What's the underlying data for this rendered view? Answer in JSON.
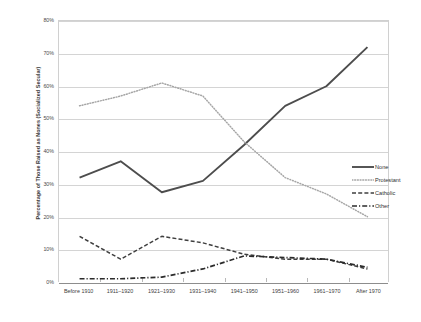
{
  "chart_data": {
    "type": "line",
    "title": "",
    "xlabel": "",
    "ylabel": "Percentage of Those Raised as Nones (Socialized Secular)",
    "ylim": [
      0,
      80
    ],
    "ytick_labels": [
      "0%",
      "10%",
      "20%",
      "30%",
      "40%",
      "50%",
      "60%",
      "70%",
      "80%"
    ],
    "ytick_values": [
      0,
      10,
      20,
      30,
      40,
      50,
      60,
      70,
      80
    ],
    "grid": true,
    "legend_position": "right",
    "categories": [
      "Before 1910",
      "1911–1920",
      "1921–1930",
      "1931–1940",
      "1941–1950",
      "1951–1960",
      "1961–1970",
      "After 1970"
    ],
    "series": [
      {
        "name": "None",
        "style": "solid",
        "color": "#4d4d4d",
        "values": [
          32,
          37,
          27.5,
          31,
          42,
          54,
          60,
          72
        ]
      },
      {
        "name": "Protestant",
        "style": "dotted",
        "color": "#a6a6a6",
        "values": [
          54,
          57,
          61,
          57,
          43,
          32,
          27,
          20
        ]
      },
      {
        "name": "Catholic",
        "style": "dashed",
        "color": "#3f3f3f",
        "values": [
          14,
          7,
          14,
          12,
          8.5,
          7,
          7,
          4
        ]
      },
      {
        "name": "Other",
        "style": "dashdot",
        "color": "#2b2b2b",
        "values": [
          1,
          1,
          1.5,
          4,
          8,
          7.5,
          7,
          4.5
        ]
      }
    ]
  },
  "legend": {
    "items": [
      {
        "label": "None"
      },
      {
        "label": "Protestant"
      },
      {
        "label": "Catholic"
      },
      {
        "label": "Other"
      }
    ]
  }
}
